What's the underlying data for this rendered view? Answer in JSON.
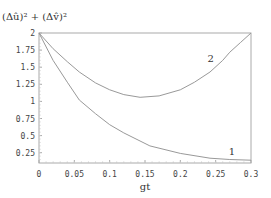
{
  "chart_data": {
    "type": "line",
    "title": "",
    "ylabel": "(Δû)² + (Δv̂)²",
    "xlabel": "gt",
    "xlim": [
      0,
      0.3
    ],
    "ylim": [
      0.12,
      2
    ],
    "x_ticks": [
      "0",
      "0.05",
      "0.1",
      "0.15",
      "0.2",
      "0.25",
      "0.3"
    ],
    "y_ticks": [
      "0.25",
      "0.5",
      "0.75",
      "1",
      "1.25",
      "1.5",
      "1.75",
      "2"
    ],
    "grid": false,
    "legend": "none (inline curve labels)",
    "series": [
      {
        "name": "1",
        "x": [
          0,
          0.02,
          0.04,
          0.057,
          0.08,
          0.1,
          0.12,
          0.157,
          0.2,
          0.242,
          0.27,
          0.3
        ],
        "values": [
          2.0,
          1.6,
          1.28,
          1.02,
          0.82,
          0.66,
          0.54,
          0.35,
          0.24,
          0.17,
          0.15,
          0.14
        ]
      },
      {
        "name": "2",
        "x": [
          0,
          0.02,
          0.04,
          0.057,
          0.08,
          0.1,
          0.12,
          0.143,
          0.17,
          0.2,
          0.22,
          0.242,
          0.26,
          0.27,
          0.285,
          0.3
        ],
        "values": [
          2.0,
          1.77,
          1.58,
          1.43,
          1.27,
          1.17,
          1.1,
          1.06,
          1.08,
          1.17,
          1.28,
          1.43,
          1.6,
          1.72,
          1.86,
          2.0
        ]
      }
    ],
    "annotations": [
      {
        "text": "1",
        "x": 0.273,
        "y": 0.22
      },
      {
        "text": "2",
        "x": 0.243,
        "y": 1.58
      }
    ]
  }
}
